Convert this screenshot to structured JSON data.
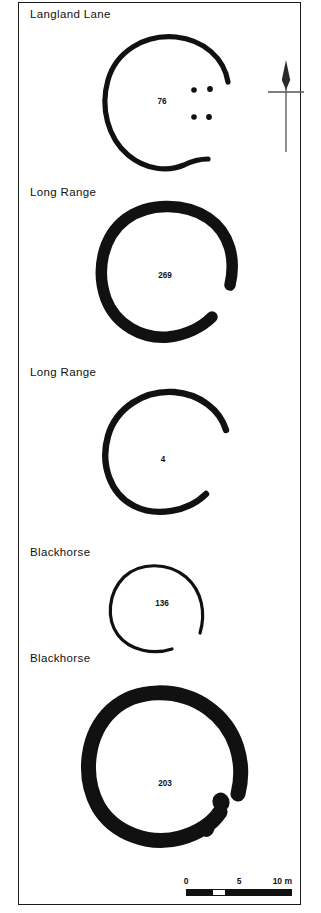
{
  "figure": {
    "background_color": "#ffffff",
    "ink_color": "#111111"
  },
  "plans": [
    {
      "site_label": "Langland Lane",
      "feature_number": "76",
      "ditch_style": "medium",
      "gap_position": "east",
      "internal_features": "four pits"
    },
    {
      "site_label": "Long Range",
      "feature_number": "269",
      "ditch_style": "thick",
      "gap_position": "east",
      "internal_features": "none"
    },
    {
      "site_label": "Long Range",
      "feature_number": "4",
      "ditch_style": "medium",
      "gap_position": "east",
      "internal_features": "none"
    },
    {
      "site_label": "Blackhorse",
      "feature_number": "136",
      "ditch_style": "thin",
      "gap_position": "southeast",
      "internal_features": "none"
    },
    {
      "site_label": "Blackhorse",
      "feature_number": "203",
      "ditch_style": "very-thick",
      "gap_position": "east",
      "internal_features": "two pits"
    }
  ],
  "north_arrow": {
    "name": "north-arrow",
    "direction": "up"
  },
  "scale_bar": {
    "labels": {
      "start": "0",
      "middle": "5",
      "end": "10 m"
    },
    "units": "m",
    "min": 0,
    "max": 10,
    "divisions": 4
  }
}
